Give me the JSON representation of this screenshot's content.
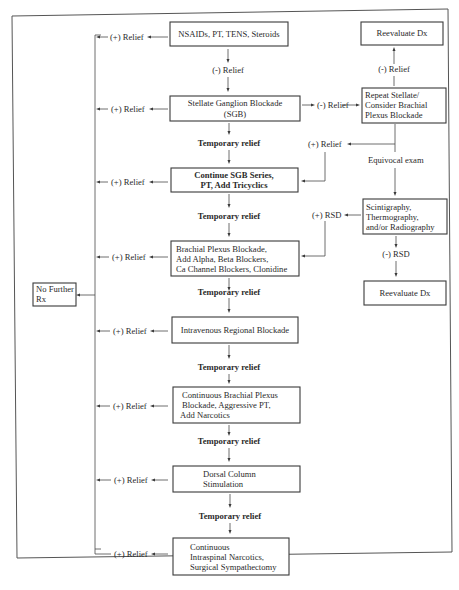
{
  "diagram": {
    "type": "flowchart",
    "boxes": {
      "nsaids": [
        "NSAIDs, PT, TENS, Steroids"
      ],
      "sgb": [
        "Stellate Ganglion Blockade",
        "(SGB)"
      ],
      "continue_sgb": [
        "Continue SGB Series,",
        "PT, Add Tricyclics"
      ],
      "brachial_plexus": [
        "Brachial Plexus Blockade,",
        "Add Alpha, Beta Blockers,",
        "Ca Channel Blockers, Clonidine"
      ],
      "iv_regional": [
        "Intravenous Regional Blockade"
      ],
      "continuous_brachial": [
        "Continuous Brachial Plexus",
        "Blockade, Aggressive PT,",
        "Add Narcotics"
      ],
      "dorsal_column": [
        "Dorsal Column",
        "Stimulation"
      ],
      "intraspinal": [
        "Continuous",
        "Intraspinal Narcotics,",
        "Surgical Sympathectomy"
      ],
      "reevaluate_top": [
        "Reevaluate Dx"
      ],
      "repeat_stellate": [
        "Repeat Stellate/",
        "Consider Brachial",
        "Plexus Blockade"
      ],
      "scintigraphy": [
        "Scintigraphy,",
        "Thermography,",
        "and/or Radiography"
      ],
      "reevaluate_bottom": [
        "Reevaluate Dx"
      ],
      "no_further_rx": [
        "No Further",
        "Rx"
      ]
    },
    "labels": {
      "plus_relief": "(+) Relief",
      "minus_relief": "(-) Relief",
      "temporary_relief": "Temporary relief",
      "equivocal_exam": "Equivocal exam",
      "plus_rsd": "(+) RSD",
      "minus_rsd": "(-) RSD"
    },
    "edges": [
      {
        "from": "nsaids",
        "to": "sgb",
        "label": "(-) Relief"
      },
      {
        "from": "sgb",
        "to": "continue_sgb",
        "label": "Temporary relief"
      },
      {
        "from": "continue_sgb",
        "to": "brachial_plexus",
        "label": "Temporary relief"
      },
      {
        "from": "brachial_plexus",
        "to": "iv_regional",
        "label": "Temporary relief"
      },
      {
        "from": "iv_regional",
        "to": "continuous_brachial",
        "label": "Temporary relief"
      },
      {
        "from": "continuous_brachial",
        "to": "dorsal_column",
        "label": "Temporary relief"
      },
      {
        "from": "dorsal_column",
        "to": "intraspinal",
        "label": "Temporary relief"
      },
      {
        "from": "sgb",
        "to": "repeat_stellate",
        "label": "(-) Relief"
      },
      {
        "from": "repeat_stellate",
        "to": "reevaluate_top",
        "label": "(-) Relief"
      },
      {
        "from": "repeat_stellate",
        "to": "continue_sgb",
        "label": "(+) Relief"
      },
      {
        "from": "repeat_stellate",
        "to": "scintigraphy",
        "label": "Equivocal exam"
      },
      {
        "from": "scintigraphy",
        "to": "brachial_plexus",
        "label": "(+) RSD"
      },
      {
        "from": "scintigraphy",
        "to": "reevaluate_bottom",
        "label": "(-) RSD"
      },
      {
        "from": "nsaids",
        "to": "no_further_rx",
        "label": "(+) Relief"
      },
      {
        "from": "sgb",
        "to": "no_further_rx",
        "label": "(+) Relief"
      },
      {
        "from": "continue_sgb",
        "to": "no_further_rx",
        "label": "(+) Relief"
      },
      {
        "from": "brachial_plexus",
        "to": "no_further_rx",
        "label": "(+) Relief"
      },
      {
        "from": "iv_regional",
        "to": "no_further_rx",
        "label": "(+) Relief"
      },
      {
        "from": "continuous_brachial",
        "to": "no_further_rx",
        "label": "(+) Relief"
      },
      {
        "from": "dorsal_column",
        "to": "no_further_rx",
        "label": "(+) Relief"
      },
      {
        "from": "intraspinal",
        "to": "no_further_rx",
        "label": "(+) Relief"
      }
    ]
  }
}
